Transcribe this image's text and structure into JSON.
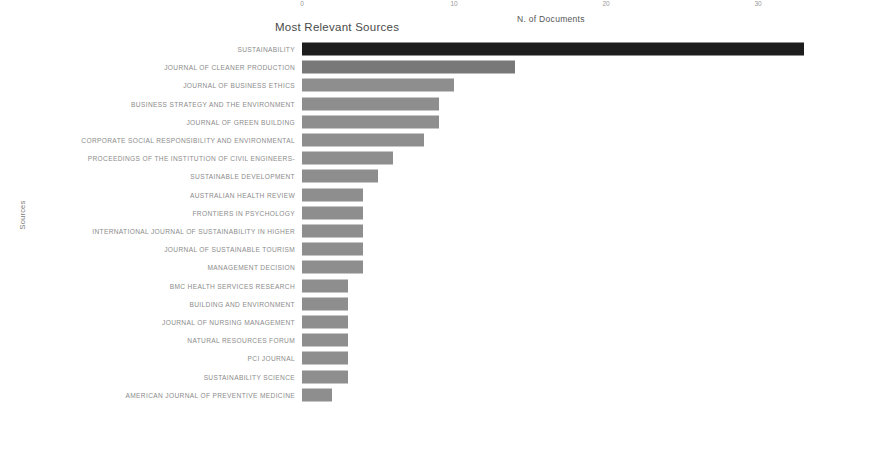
{
  "chart_data": {
    "type": "bar",
    "orientation": "horizontal",
    "title": "Most Relevant Sources",
    "xlabel": "N. of Documents",
    "ylabel": "Sources",
    "xlim": [
      0,
      36
    ],
    "xticks": [
      0,
      10,
      20,
      30
    ],
    "xtick_labels": [
      "0",
      "10",
      "20",
      "30"
    ],
    "grid": false,
    "legend": false,
    "categories": [
      "SUSTAINABILITY",
      "JOURNAL OF CLEANER PRODUCTION",
      "JOURNAL OF BUSINESS ETHICS",
      "BUSINESS STRATEGY AND THE ENVIRONMENT",
      "JOURNAL OF GREEN BUILDING",
      "CORPORATE SOCIAL RESPONSIBILITY AND ENVIRONMENTAL",
      "PROCEEDINGS OF THE INSTITUTION OF CIVIL ENGINEERS-",
      "SUSTAINABLE DEVELOPMENT",
      "AUSTRALIAN HEALTH REVIEW",
      "FRONTIERS IN PSYCHOLOGY",
      "INTERNATIONAL JOURNAL OF SUSTAINABILITY IN HIGHER",
      "JOURNAL OF SUSTAINABLE TOURISM",
      "MANAGEMENT DECISION",
      "BMC HEALTH SERVICES RESEARCH",
      "BUILDING AND ENVIRONMENT",
      "JOURNAL OF NURSING MANAGEMENT",
      "NATURAL RESOURCES FORUM",
      "PCI JOURNAL",
      "SUSTAINABILITY SCIENCE",
      "AMERICAN JOURNAL OF PREVENTIVE MEDICINE"
    ],
    "values": [
      33,
      14,
      10,
      9,
      9,
      8,
      6,
      5,
      4,
      4,
      4,
      4,
      4,
      3,
      3,
      3,
      3,
      3,
      3,
      2
    ],
    "bar_colors": [
      "#1d1d1d",
      "#787878",
      "#8e8e8e",
      "#8e8e8e",
      "#8e8e8e",
      "#8e8e8e",
      "#8e8e8e",
      "#8e8e8e",
      "#8e8e8e",
      "#8e8e8e",
      "#8e8e8e",
      "#8e8e8e",
      "#8e8e8e",
      "#8e8e8e",
      "#8e8e8e",
      "#8e8e8e",
      "#8e8e8e",
      "#8e8e8e",
      "#8e8e8e",
      "#8e8e8e"
    ]
  }
}
